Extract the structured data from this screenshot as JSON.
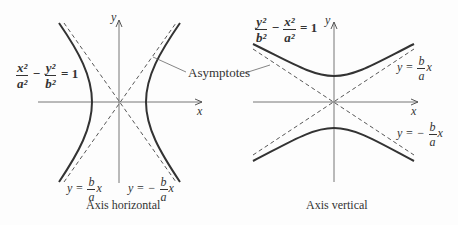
{
  "left_graph": {
    "caption": "Axis horizontal",
    "equation": {
      "num1": "x²",
      "den1": "a²",
      "op": "−",
      "num2": "y²",
      "den2": "b²",
      "rhs": "= 1"
    },
    "x_axis_label": "x",
    "y_axis_label": "y",
    "asymptote_pos": {
      "lhs": "y =",
      "num": "b",
      "den": "a",
      "var": "x"
    },
    "asymptote_neg": {
      "lhs": "y = −",
      "num": "b",
      "den": "a",
      "var": "x"
    }
  },
  "right_graph": {
    "caption": "Axis vertical",
    "equation": {
      "num1": "y²",
      "den1": "b²",
      "op": "−",
      "num2": "x²",
      "den2": "a²",
      "rhs": "= 1"
    },
    "x_axis_label": "x",
    "y_axis_label": "y",
    "asymptote_pos": {
      "lhs": "y =",
      "num": "b",
      "den": "a",
      "var": "x"
    },
    "asymptote_neg": {
      "lhs": "y = −",
      "num": "b",
      "den": "a",
      "var": "x"
    }
  },
  "shared_label": "Asymptotes",
  "colors": {
    "curve": "#333333",
    "axis": "#555555",
    "asymptote": "#444444",
    "background": "#fdfdfd"
  }
}
